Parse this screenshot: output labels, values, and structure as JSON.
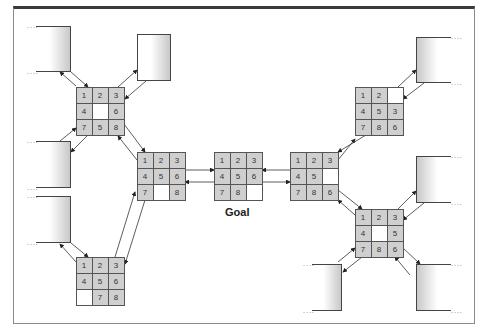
{
  "diagram": {
    "goal_label": "Goal",
    "grids": {
      "top_left": {
        "cells": [
          "1",
          "2",
          "3",
          "4",
          "",
          "6",
          "7",
          "5",
          "8"
        ]
      },
      "mid_left": {
        "cells": [
          "1",
          "2",
          "3",
          "4",
          "5",
          "6",
          "7",
          "",
          "8"
        ]
      },
      "bottom_left": {
        "cells": [
          "1",
          "2",
          "3",
          "4",
          "5",
          "6",
          "",
          "7",
          "8"
        ]
      },
      "goal": {
        "cells": [
          "1",
          "2",
          "3",
          "4",
          "5",
          "6",
          "7",
          "8",
          ""
        ]
      },
      "mid_right": {
        "cells": [
          "1",
          "2",
          "3",
          "4",
          "5",
          "",
          "7",
          "8",
          "6"
        ]
      },
      "top_right": {
        "cells": [
          "1",
          "2",
          "",
          "4",
          "5",
          "3",
          "7",
          "8",
          "6"
        ]
      },
      "bottom_right": {
        "cells": [
          "1",
          "2",
          "3",
          "4",
          "",
          "5",
          "7",
          "8",
          "6"
        ]
      }
    },
    "continuation_marker": "....",
    "colors": {
      "tile": "#cfcfcf",
      "blank": "#ffffff",
      "border": "#555555",
      "frame_top": "#3a3a3a"
    }
  }
}
